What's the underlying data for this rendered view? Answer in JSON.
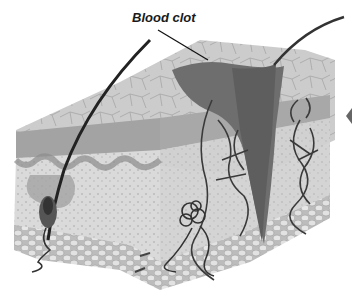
{
  "figure": {
    "labels": [
      {
        "id": "blood-clot",
        "text": "Blood clot"
      }
    ],
    "parts": [
      "epidermis-surface",
      "epidermis-layer",
      "dermis",
      "hair-shaft",
      "hair-follicle",
      "blood-clot-wound",
      "blood-vessels",
      "sweat-gland",
      "subcutaneous-fat"
    ],
    "colors": {
      "background": "#ffffff",
      "surface": "#c9c9c9",
      "epidermis": "#9a9a9a",
      "dermis": "#d8d8d8",
      "clot": "#6e6e6e",
      "vessel": "#3a3a3a",
      "fat": "#cfcfcf",
      "text": "#1a1a1a"
    }
  }
}
